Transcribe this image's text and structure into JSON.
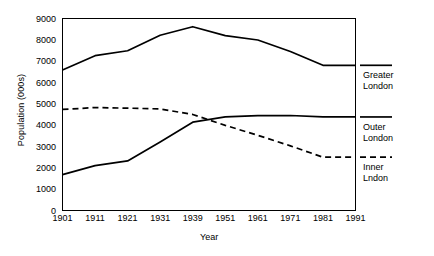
{
  "chart_data": {
    "type": "line",
    "title": "",
    "xlabel": "Year",
    "ylabel": "Population (000s)",
    "categories": [
      "1901",
      "1911",
      "1921",
      "1931",
      "1939",
      "1951",
      "1961",
      "1971",
      "1981",
      "1991"
    ],
    "ylim": [
      0,
      9000
    ],
    "yticks": [
      "0",
      "1000",
      "2000",
      "3000",
      "4000",
      "5000",
      "6000",
      "7000",
      "8000",
      "9000"
    ],
    "grid": false,
    "legend_position": "right",
    "series": [
      {
        "name": "Greater London",
        "style": "solid",
        "color": "#000000",
        "values": [
          6586,
          7256,
          7488,
          8216,
          8615,
          8197,
          7992,
          7452,
          6806,
          6806
        ]
      },
      {
        "name": "Outer London",
        "style": "solid",
        "color": "#000000",
        "values": [
          1682,
          2105,
          2323,
          3215,
          4139,
          4386,
          4450,
          4452,
          4385,
          4385
        ]
      },
      {
        "name": "Inner London",
        "style": "dashed",
        "color": "#000000",
        "values": [
          4736,
          4825,
          4798,
          4760,
          4502,
          3990,
          3525,
          3031,
          2498,
          2498
        ]
      }
    ]
  },
  "legend": {
    "greater": {
      "line1": "Greater",
      "line2": "London"
    },
    "outer": {
      "line1": "Outer",
      "line2": "London"
    },
    "inner": {
      "line1": "Inner",
      "line2": "Lndon"
    }
  },
  "axes": {
    "y_title": "Population (000s)",
    "x_title": "Year"
  }
}
